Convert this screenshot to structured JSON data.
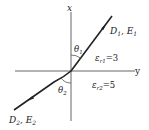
{
  "diagram": {
    "axes": {
      "vertical_label": "x",
      "horizontal_label": "y"
    },
    "region1": {
      "field_label_main": "D",
      "field_sub1": "1",
      "field_sep": ", E",
      "field_sub2": "1",
      "angle_label": "θ",
      "angle_sub": "1",
      "permittivity_symbol": "ε",
      "permittivity_sub": "r1",
      "permittivity_value": "=3"
    },
    "region2": {
      "field_label_main": "D",
      "field_sub1": "2",
      "field_sep": ", E",
      "field_sub2": "2",
      "angle_label": "θ",
      "angle_sub": "2",
      "permittivity_symbol": "ε",
      "permittivity_sub": "r2",
      "permittivity_value": "=5"
    },
    "colors": {
      "line": "#222222",
      "axis": "#555555",
      "background": "#ffffff"
    }
  }
}
